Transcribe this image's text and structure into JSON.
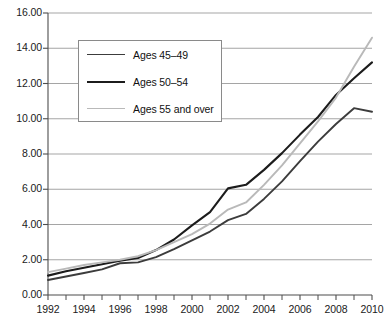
{
  "chart_data": {
    "type": "line",
    "title": "",
    "subtitle": "",
    "xlabel": "",
    "ylabel": "",
    "xlim": [
      1992,
      2010
    ],
    "ylim": [
      0.0,
      16.0
    ],
    "grid": true,
    "grid_axis": "y",
    "legend_position": "upper-left-inside",
    "x": [
      1992,
      1993,
      1994,
      1995,
      1996,
      1997,
      1998,
      1999,
      2000,
      2001,
      2002,
      2003,
      2004,
      2005,
      2006,
      2007,
      2008,
      2009,
      2010
    ],
    "xticks": [
      1992,
      1994,
      1996,
      1998,
      2000,
      2002,
      2004,
      2006,
      2008,
      2010
    ],
    "xtick_labels": [
      "1992",
      "1994",
      "1996",
      "1998",
      "2000",
      "2002",
      "2004",
      "2006",
      "2008",
      "2010"
    ],
    "xminor_ticks": [
      1993,
      1995,
      1997,
      1999,
      2001,
      2003,
      2005,
      2007,
      2009
    ],
    "yticks": [
      0.0,
      2.0,
      4.0,
      6.0,
      8.0,
      10.0,
      12.0,
      14.0,
      16.0
    ],
    "ytick_labels": [
      "0.00",
      "2.00",
      "4.00",
      "6.00",
      "8.00",
      "10.00",
      "12.00",
      "14.00",
      "16.00"
    ],
    "series": [
      {
        "name": "Ages 45–49",
        "color": "#3c3c3c",
        "width": 1.9,
        "values": [
          0.85,
          1.05,
          1.25,
          1.45,
          1.8,
          1.85,
          2.15,
          2.6,
          3.1,
          3.6,
          4.25,
          4.6,
          5.45,
          6.45,
          7.6,
          8.7,
          9.7,
          10.6,
          10.4
        ]
      },
      {
        "name": "Ages 50–54",
        "color": "#1c1c1c",
        "width": 2.1,
        "values": [
          1.1,
          1.35,
          1.55,
          1.75,
          1.95,
          2.1,
          2.55,
          3.15,
          3.95,
          4.7,
          6.05,
          6.25,
          7.1,
          8.05,
          9.1,
          10.1,
          11.35,
          12.3,
          13.2
        ]
      },
      {
        "name": "Ages 55 and over",
        "color": "#b9b9b9",
        "width": 1.9,
        "values": [
          1.3,
          1.5,
          1.7,
          1.85,
          2.0,
          2.2,
          2.55,
          3.0,
          3.45,
          4.05,
          4.85,
          5.25,
          6.25,
          7.35,
          8.6,
          9.85,
          11.2,
          12.95,
          14.6
        ]
      }
    ]
  },
  "legend": {
    "items": [
      {
        "label": "Ages 45–49",
        "color": "#3c3c3c"
      },
      {
        "label": "Ages 50–54",
        "color": "#1c1c1c"
      },
      {
        "label": "Ages 55 and over",
        "color": "#b9b9b9"
      }
    ]
  },
  "axes": {
    "axis_color": "#4d4d4d",
    "grid_color": "#9b9b9b",
    "text_color": "#1a1a1a"
  }
}
